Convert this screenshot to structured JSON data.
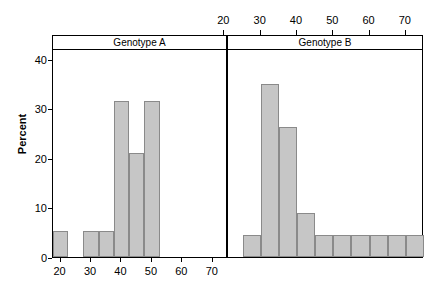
{
  "chart_data": {
    "type": "bar",
    "title": "",
    "subtitle": "",
    "xlabel": "",
    "ylabel": "Percent",
    "ylim": [
      0,
      42
    ],
    "yticks": [
      0,
      10,
      20,
      30,
      40
    ],
    "ytick_labels": [
      "0",
      "10",
      "20",
      "30",
      "40"
    ],
    "grid": false,
    "legend": "none",
    "panel_layout": "two panels side-by-side, shared Percent axis",
    "panels": [
      {
        "label": "Genotype A",
        "axis_position": "bottom",
        "xlim": [
          17.5,
          75
        ],
        "xticks": [
          20,
          30,
          40,
          50,
          60,
          70
        ],
        "xtick_labels": [
          "20",
          "30",
          "40",
          "50",
          "60",
          "70"
        ],
        "bin_width": 5,
        "bins": [
          {
            "x0": 17.5,
            "x1": 22.5,
            "value": 5.3
          },
          {
            "x0": 22.5,
            "x1": 27.5,
            "value": 0
          },
          {
            "x0": 27.5,
            "x1": 32.5,
            "value": 5.3
          },
          {
            "x0": 32.5,
            "x1": 37.5,
            "value": 5.3
          },
          {
            "x0": 37.5,
            "x1": 42.5,
            "value": 31.6
          },
          {
            "x0": 42.5,
            "x1": 47.5,
            "value": 21.1
          },
          {
            "x0": 47.5,
            "x1": 52.5,
            "value": 31.6
          },
          {
            "x0": 52.5,
            "x1": 57.5,
            "value": 0
          },
          {
            "x0": 57.5,
            "x1": 62.5,
            "value": 0
          },
          {
            "x0": 62.5,
            "x1": 67.5,
            "value": 0
          },
          {
            "x0": 67.5,
            "x1": 72.5,
            "value": 0
          }
        ]
      },
      {
        "label": "Genotype B",
        "axis_position": "top",
        "xlim": [
          21,
          75
        ],
        "xticks": [
          20,
          30,
          40,
          50,
          60,
          70
        ],
        "xtick_labels": [
          "20",
          "30",
          "40",
          "50",
          "60",
          "70"
        ],
        "bin_width": 5,
        "bins": [
          {
            "x0": 25,
            "x1": 30,
            "value": 4.4
          },
          {
            "x0": 30,
            "x1": 35,
            "value": 35.0
          },
          {
            "x0": 35,
            "x1": 40,
            "value": 26.3
          },
          {
            "x0": 40,
            "x1": 45,
            "value": 8.8
          },
          {
            "x0": 45,
            "x1": 50,
            "value": 4.4
          },
          {
            "x0": 50,
            "x1": 55,
            "value": 4.4
          },
          {
            "x0": 55,
            "x1": 60,
            "value": 4.4
          },
          {
            "x0": 60,
            "x1": 65,
            "value": 4.4
          },
          {
            "x0": 65,
            "x1": 70,
            "value": 4.4
          },
          {
            "x0": 70,
            "x1": 75,
            "value": 4.4
          }
        ]
      }
    ],
    "colors": {
      "bar_fill": "#c6c6c6",
      "bar_stroke": "#8a8a8a",
      "axis": "#000000",
      "background": "#ffffff",
      "strip_background": "#ffffff"
    }
  }
}
